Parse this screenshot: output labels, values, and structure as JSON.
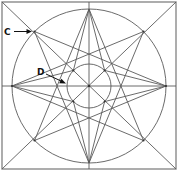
{
  "diagram": {
    "title": "",
    "labels": {
      "c": "C",
      "d": "D"
    },
    "geometry": {
      "square": {
        "x1": 2,
        "y1": 2,
        "x2": 176,
        "y2": 169
      },
      "center": {
        "x": 89,
        "y": 86
      },
      "outer_radius": 77,
      "inner_radius": 22
    },
    "annotations": [
      {
        "label": "C",
        "points_to": "intersection of diagonal with outer circle (upper-left star tip)"
      },
      {
        "label": "D",
        "points_to": "left side of inner circle"
      }
    ],
    "colors": {
      "lines": "#5a5a5a",
      "frame": "#8a8a8a",
      "labels": "#111111"
    }
  }
}
